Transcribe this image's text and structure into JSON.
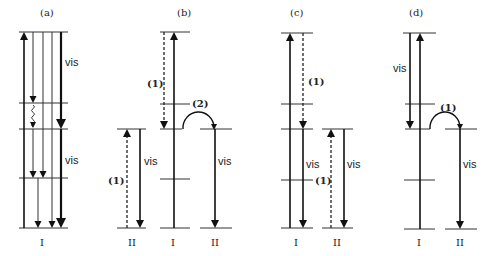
{
  "figure": {
    "panels": [
      {
        "id": "a",
        "label": "(a)",
        "label_pos": [
          40,
          16
        ],
        "levels": [
          {
            "y": 32,
            "x1": 19,
            "x2": 68
          },
          {
            "y": 103,
            "x1": 19,
            "x2": 68
          },
          {
            "y": 129,
            "x1": 19,
            "x2": 68
          },
          {
            "y": 178,
            "x1": 19,
            "x2": 68
          },
          {
            "y": 228,
            "x1": 19,
            "x2": 68
          }
        ],
        "arrows": [
          {
            "type": "solid",
            "x1": 24,
            "y1": 228,
            "x2": 24,
            "y2": 32
          },
          {
            "type": "thin",
            "x1": 33,
            "y1": 32,
            "x2": 33,
            "y2": 103
          },
          {
            "type": "thin",
            "x1": 33,
            "y1": 129,
            "x2": 33,
            "y2": 178
          },
          {
            "type": "thin",
            "x1": 43,
            "y1": 32,
            "x2": 43,
            "y2": 178
          },
          {
            "type": "thin",
            "x1": 38,
            "y1": 178,
            "x2": 38,
            "y2": 228
          },
          {
            "type": "thin",
            "x1": 52,
            "y1": 32,
            "x2": 52,
            "y2": 228
          },
          {
            "type": "thick",
            "x1": 61,
            "y1": 32,
            "x2": 61,
            "y2": 129
          },
          {
            "type": "thick",
            "x1": 61,
            "y1": 129,
            "x2": 61,
            "y2": 228
          }
        ],
        "wavy": [
          {
            "x": 33,
            "y1": 105,
            "y2": 127
          }
        ],
        "texts": [
          {
            "kind": "vis",
            "text": "vis",
            "x": 65,
            "y": 66
          },
          {
            "kind": "vis",
            "text": "vis",
            "x": 65,
            "y": 164
          },
          {
            "kind": "roman",
            "text": "I",
            "x": 40,
            "y": 246
          }
        ]
      },
      {
        "id": "b",
        "label": "(b)",
        "label_pos": [
          177,
          16
        ],
        "levels": [
          {
            "y": 129,
            "x1": 117,
            "x2": 146
          },
          {
            "y": 228,
            "x1": 117,
            "x2": 146
          },
          {
            "y": 32,
            "x1": 160,
            "x2": 190
          },
          {
            "y": 104,
            "x1": 160,
            "x2": 190
          },
          {
            "y": 129,
            "x1": 160,
            "x2": 182
          },
          {
            "y": 179,
            "x1": 160,
            "x2": 190
          },
          {
            "y": 228,
            "x1": 160,
            "x2": 190
          },
          {
            "y": 129,
            "x1": 200,
            "x2": 232
          },
          {
            "y": 228,
            "x1": 200,
            "x2": 232
          }
        ],
        "arrows": [
          {
            "type": "dash",
            "x1": 127,
            "y1": 228,
            "x2": 127,
            "y2": 129
          },
          {
            "type": "solid",
            "x1": 140,
            "y1": 129,
            "x2": 140,
            "y2": 228
          },
          {
            "type": "dash",
            "x1": 164,
            "y1": 32,
            "x2": 164,
            "y2": 129
          },
          {
            "type": "solid",
            "x1": 174,
            "y1": 228,
            "x2": 174,
            "y2": 32
          },
          {
            "type": "solid",
            "x1": 215,
            "y1": 129,
            "x2": 215,
            "y2": 228
          }
        ],
        "arcs": [
          {
            "x1": 183,
            "x2": 214,
            "y": 129,
            "h": 16
          }
        ],
        "texts": [
          {
            "kind": "proc",
            "text": "(1)",
            "x": 147,
            "y": 87
          },
          {
            "kind": "proc",
            "text": "(2)",
            "x": 192,
            "y": 107
          },
          {
            "kind": "proc",
            "text": "(1)",
            "x": 108,
            "y": 184
          },
          {
            "kind": "vis",
            "text": "vis",
            "x": 144,
            "y": 165
          },
          {
            "kind": "vis",
            "text": "vis",
            "x": 218,
            "y": 165
          },
          {
            "kind": "roman",
            "text": "II",
            "x": 128,
            "y": 246
          },
          {
            "kind": "roman",
            "text": "I",
            "x": 171,
            "y": 246
          },
          {
            "kind": "roman",
            "text": "II",
            "x": 211,
            "y": 246
          }
        ]
      },
      {
        "id": "c",
        "label": "(c)",
        "label_pos": [
          290,
          16
        ],
        "levels": [
          {
            "y": 33,
            "x1": 281,
            "x2": 313
          },
          {
            "y": 104,
            "x1": 281,
            "x2": 313
          },
          {
            "y": 129,
            "x1": 281,
            "x2": 313
          },
          {
            "y": 180,
            "x1": 281,
            "x2": 313
          },
          {
            "y": 228,
            "x1": 281,
            "x2": 313
          },
          {
            "y": 129,
            "x1": 322,
            "x2": 353
          },
          {
            "y": 228,
            "x1": 322,
            "x2": 353
          }
        ],
        "arrows": [
          {
            "type": "solid",
            "x1": 290,
            "y1": 228,
            "x2": 290,
            "y2": 33
          },
          {
            "type": "dash",
            "x1": 303,
            "y1": 33,
            "x2": 303,
            "y2": 129
          },
          {
            "type": "solid",
            "x1": 303,
            "y1": 129,
            "x2": 303,
            "y2": 228
          },
          {
            "type": "dash",
            "x1": 331,
            "y1": 228,
            "x2": 331,
            "y2": 129
          },
          {
            "type": "solid",
            "x1": 344,
            "y1": 129,
            "x2": 344,
            "y2": 228
          }
        ],
        "texts": [
          {
            "kind": "proc",
            "text": "(1)",
            "x": 308,
            "y": 85
          },
          {
            "kind": "proc",
            "text": "(1)",
            "x": 315,
            "y": 184
          },
          {
            "kind": "vis",
            "text": "vis",
            "x": 306,
            "y": 168
          },
          {
            "kind": "vis",
            "text": "vis",
            "x": 347,
            "y": 168
          },
          {
            "kind": "roman",
            "text": "I",
            "x": 294,
            "y": 246
          },
          {
            "kind": "roman",
            "text": "II",
            "x": 333,
            "y": 246
          }
        ]
      },
      {
        "id": "d",
        "label": "(d)",
        "label_pos": [
          409,
          16
        ],
        "levels": [
          {
            "y": 33,
            "x1": 403,
            "x2": 436
          },
          {
            "y": 104,
            "x1": 405,
            "x2": 435
          },
          {
            "y": 129,
            "x1": 405,
            "x2": 430
          },
          {
            "y": 180,
            "x1": 404,
            "x2": 435
          },
          {
            "y": 229,
            "x1": 404,
            "x2": 435
          },
          {
            "y": 129,
            "x1": 445,
            "x2": 477
          },
          {
            "y": 229,
            "x1": 445,
            "x2": 477
          }
        ],
        "arrows": [
          {
            "type": "solid",
            "x1": 410,
            "y1": 33,
            "x2": 410,
            "y2": 129
          },
          {
            "type": "solid",
            "x1": 420,
            "y1": 229,
            "x2": 420,
            "y2": 33
          },
          {
            "type": "solid",
            "x1": 460,
            "y1": 129,
            "x2": 460,
            "y2": 229
          }
        ],
        "arcs": [
          {
            "x1": 430,
            "x2": 460,
            "y": 129,
            "h": 16
          }
        ],
        "texts": [
          {
            "kind": "proc",
            "text": "(1)",
            "x": 440,
            "y": 111
          },
          {
            "kind": "vis",
            "text": "vis",
            "x": 393,
            "y": 72
          },
          {
            "kind": "vis",
            "text": "vis",
            "x": 463,
            "y": 168
          },
          {
            "kind": "roman",
            "text": "I",
            "x": 417,
            "y": 246
          },
          {
            "kind": "roman",
            "text": "II",
            "x": 456,
            "y": 246
          }
        ]
      }
    ],
    "legend_meaning": {
      "vis": "visible emission",
      "(1)": "energy transfer process 1",
      "(2)": "energy transfer process 2",
      "I": "ion species I",
      "II": "ion species II"
    }
  }
}
